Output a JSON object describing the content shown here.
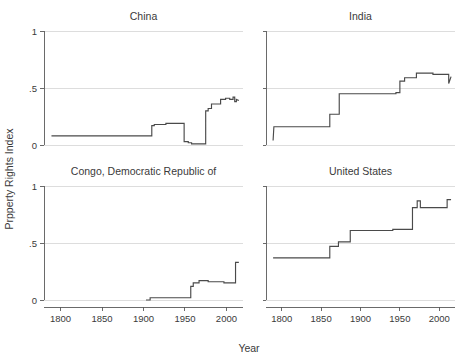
{
  "figure": {
    "ylabel": "Prpperty Rights Index",
    "xlabel": "Year",
    "background_color": "#ffffff",
    "line_color": "#4a4a4a",
    "grid_color": "#d4d4d4",
    "axis_color": "#5a5a5a"
  },
  "chart_data": {
    "type": "line",
    "title": "",
    "xlabel": "Year",
    "ylabel": "Prpperty Rights Index",
    "xlim": [
      1780,
      2020
    ],
    "ylim": [
      0,
      1
    ],
    "xticks": [
      1800,
      1850,
      1900,
      1950,
      2000
    ],
    "xtick_labels": [
      "1800",
      "1850",
      "1900",
      "1950",
      "2000"
    ],
    "yticks": [
      0,
      0.5,
      1
    ],
    "ytick_labels": [
      "0",
      ".5",
      "1"
    ],
    "grid": true,
    "legend": "none",
    "layout": "2x2 small multiples",
    "panels": [
      {
        "title": "China",
        "row": 0,
        "col": 0,
        "x": [
          1789,
          1910,
          1910,
          1913,
          1913,
          1927,
          1927,
          1936,
          1936,
          1949,
          1949,
          1954,
          1954,
          1958,
          1958,
          1975,
          1975,
          1978,
          1978,
          1982,
          1982,
          1993,
          1993,
          1999,
          1999,
          2004,
          2004,
          2008,
          2008,
          2010,
          2010,
          2012,
          2012,
          2015
        ],
        "y": [
          0.08,
          0.08,
          0.17,
          0.17,
          0.18,
          0.18,
          0.19,
          0.19,
          0.19,
          0.19,
          0.03,
          0.03,
          0.02,
          0.02,
          0.01,
          0.01,
          0.3,
          0.3,
          0.32,
          0.32,
          0.36,
          0.36,
          0.4,
          0.4,
          0.41,
          0.41,
          0.4,
          0.4,
          0.42,
          0.42,
          0.38,
          0.38,
          0.4,
          0.39
        ],
        "series_name": "China"
      },
      {
        "title": "India",
        "row": 0,
        "col": 1,
        "x": [
          1789,
          1790,
          1861,
          1861,
          1873,
          1873,
          1945,
          1945,
          1950,
          1950,
          1956,
          1956,
          1971,
          1971,
          1992,
          1992,
          2012,
          2012,
          2015
        ],
        "y": [
          0.04,
          0.16,
          0.16,
          0.27,
          0.27,
          0.45,
          0.45,
          0.46,
          0.46,
          0.56,
          0.56,
          0.59,
          0.59,
          0.63,
          0.63,
          0.62,
          0.62,
          0.54,
          0.6
        ],
        "series_name": "India"
      },
      {
        "title": "Congo, Democratic Republic of",
        "row": 1,
        "col": 0,
        "x": [
          1903,
          1908,
          1908,
          1957,
          1957,
          1960,
          1960,
          1967,
          1967,
          1978,
          1978,
          1997,
          1997,
          2011,
          2011,
          2015
        ],
        "y": [
          0.0,
          0.0,
          0.02,
          0.02,
          0.12,
          0.12,
          0.15,
          0.15,
          0.17,
          0.17,
          0.16,
          0.16,
          0.15,
          0.15,
          0.33,
          0.33
        ],
        "series_name": "Congo, Democratic Republic of"
      },
      {
        "title": "United States",
        "row": 1,
        "col": 1,
        "x": [
          1789,
          1861,
          1861,
          1872,
          1872,
          1887,
          1887,
          1896,
          1896,
          1941,
          1941,
          1966,
          1966,
          1972,
          1972,
          1976,
          1976,
          2010,
          2010,
          2015
        ],
        "y": [
          0.37,
          0.37,
          0.47,
          0.47,
          0.51,
          0.51,
          0.61,
          0.61,
          0.61,
          0.61,
          0.62,
          0.62,
          0.81,
          0.81,
          0.87,
          0.87,
          0.81,
          0.81,
          0.88,
          0.88
        ],
        "series_name": "United States"
      }
    ]
  }
}
